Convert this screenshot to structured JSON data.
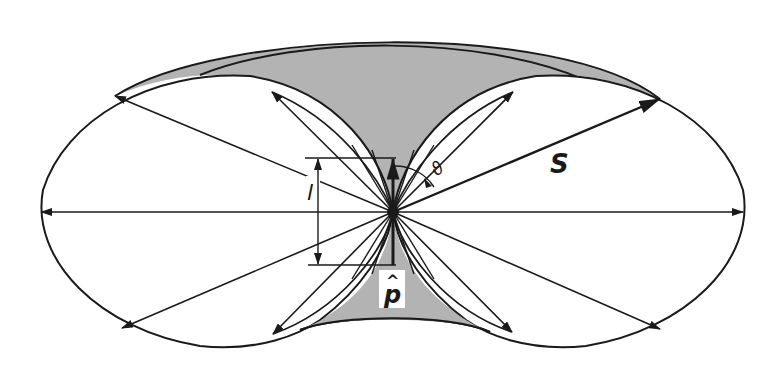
{
  "diagram": {
    "labels": {
      "poynting": "S",
      "length": "l",
      "angle": "ϑ",
      "dipole_moment": "p",
      "dipole_hat": "^"
    },
    "colors": {
      "background": "#ffffff",
      "stroke": "#1a1a1a",
      "shaded_region": "#b3b3b3"
    },
    "center": [
      393,
      212
    ],
    "arrows_right": [
      {
        "to": [
          743,
          212
        ]
      },
      {
        "to": [
          660,
          99
        ],
        "bold": true,
        "label": "S"
      },
      {
        "to": [
          513,
          92
        ]
      },
      {
        "to": [
          660,
          329
        ]
      },
      {
        "to": [
          512,
          332
        ]
      }
    ],
    "arrows_left": [
      {
        "to": [
          41,
          212
        ]
      },
      {
        "to": [
          115,
          96
        ]
      },
      {
        "to": [
          272,
          92
        ]
      },
      {
        "to": [
          122,
          328
        ]
      },
      {
        "to": [
          273,
          334
        ]
      }
    ]
  }
}
